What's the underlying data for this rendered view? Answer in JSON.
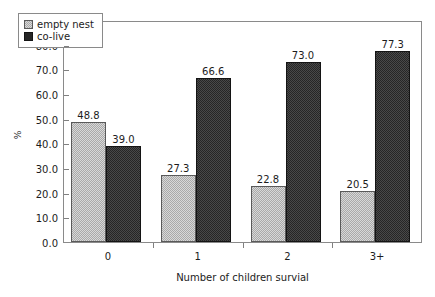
{
  "chart_data": {
    "type": "bar",
    "title": "",
    "subtitle": "",
    "xlabel": "Number of children survial",
    "ylabel": "%",
    "categories": [
      "0",
      "1",
      "2",
      "3+"
    ],
    "series": [
      {
        "name": "empty nest",
        "color": "#a9a9a9",
        "values": [
          48.8,
          27.3,
          22.8,
          20.5
        ],
        "labels": [
          "48.8",
          "27.3",
          "22.8",
          "20.5"
        ]
      },
      {
        "name": "co-live",
        "color": "#262626",
        "values": [
          39.0,
          66.6,
          73.0,
          77.3
        ],
        "labels": [
          "39.0",
          "66.6",
          "73.0",
          "77.3"
        ]
      }
    ],
    "ylim": [
      0.0,
      90.0
    ],
    "ytick_step": 10.0,
    "ytick_labels": [
      "0.0",
      "10.0",
      "20.0",
      "30.0",
      "40.0",
      "50.0",
      "60.0",
      "70.0",
      "80.0",
      "90.0"
    ],
    "grid": false,
    "legend_position": "upper-left-inside",
    "frame": true,
    "value_labels": true
  },
  "legend": {
    "items": [
      {
        "label": "empty nest",
        "swatch": "swatch-empty-nest"
      },
      {
        "label": "co-live",
        "swatch": "swatch-co-live"
      }
    ]
  },
  "colors": {
    "empty_nest": "#a9a9a9",
    "co_live": "#262626",
    "frame": "#8a8a8a",
    "text": "#1c1c1c",
    "background": "#ffffff"
  }
}
